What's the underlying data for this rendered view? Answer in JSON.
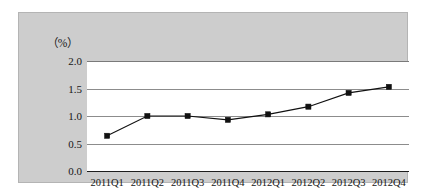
{
  "figure": {
    "unit_label": "（%）",
    "panel_color": "#cdcdcd",
    "plot_background": "#ffffff",
    "line_color": "#111111",
    "marker_color": "#111111",
    "gridline_color": "#8c8c8c"
  },
  "chart_data": {
    "type": "line",
    "title": "",
    "subtitle": "",
    "xlabel": "",
    "ylabel": "（%）",
    "categories": [
      "2011Q1",
      "2011Q2",
      "2011Q3",
      "2011Q4",
      "2012Q1",
      "2012Q2",
      "2012Q3",
      "2012Q4"
    ],
    "values": [
      0.64,
      1.0,
      1.0,
      0.93,
      1.03,
      1.17,
      1.42,
      1.53
    ],
    "series": [
      {
        "name": "",
        "values": [
          0.64,
          1.0,
          1.0,
          0.93,
          1.03,
          1.17,
          1.42,
          1.53
        ]
      }
    ],
    "ylim": [
      0.0,
      2.0
    ],
    "yticks": [
      0.0,
      0.5,
      1.0,
      1.5,
      2.0
    ],
    "ytick_labels": [
      "0.0",
      "0.5",
      "1.0",
      "1.5",
      "2.0"
    ],
    "grid": true,
    "grid_axis": "y",
    "legend": false,
    "legend_position": "none",
    "marker": "square",
    "annotations": []
  }
}
